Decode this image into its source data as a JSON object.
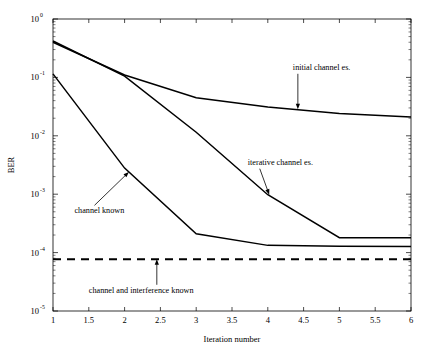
{
  "chart_data": {
    "type": "line",
    "title": "",
    "xlabel": "Iteration number",
    "ylabel": "BER",
    "xscale": "linear",
    "yscale": "log",
    "xlim": [
      1,
      6
    ],
    "ylim": [
      1e-05,
      1
    ],
    "grid": false,
    "legend": "annotations-on-plot",
    "xticks": [
      "1",
      "1.5",
      "2",
      "2.5",
      "3",
      "3.5",
      "4",
      "4.5",
      "5",
      "5.5",
      "6"
    ],
    "xtick_values": [
      1,
      1.5,
      2,
      2.5,
      3,
      3.5,
      4,
      4.5,
      5,
      5.5,
      6
    ],
    "ytick_labels": [
      "10^0",
      "10^-1",
      "10^-2",
      "10^-3",
      "10^-4",
      "10^-5"
    ],
    "ytick_mantissa": [
      "10",
      "10",
      "10",
      "10",
      "10",
      "10"
    ],
    "ytick_exponents": [
      "0",
      "-1",
      "-2",
      "-3",
      "-4",
      "-5"
    ],
    "ytick_values": [
      1,
      0.1,
      0.01,
      0.001,
      0.0001,
      1e-05
    ],
    "series": [
      {
        "name": "initial channel es.",
        "style": "solid",
        "x": [
          1,
          2,
          3,
          4,
          5,
          6
        ],
        "values": [
          0.4,
          0.11,
          0.045,
          0.031,
          0.024,
          0.021
        ]
      },
      {
        "name": "iterative channel es.",
        "style": "solid",
        "x": [
          1,
          2,
          3,
          4,
          5,
          6
        ],
        "values": [
          0.42,
          0.105,
          0.0115,
          0.00098,
          0.00018,
          0.00018
        ]
      },
      {
        "name": "channel known",
        "style": "solid",
        "x": [
          1,
          2,
          3,
          4,
          5,
          6
        ],
        "values": [
          0.115,
          0.0028,
          0.00021,
          0.000133,
          0.000128,
          0.000127
        ]
      },
      {
        "name": "channel and interference known",
        "style": "dashed",
        "x": [
          1,
          6
        ],
        "values": [
          7.7e-05,
          7.7e-05
        ]
      }
    ],
    "annotations": [
      {
        "label": "initial channel es.",
        "text_x": 4.35,
        "text_y": 0.135,
        "point_x": 4.42,
        "point_y": 0.0285,
        "arrow": "down"
      },
      {
        "label": "iterative channel es.",
        "text_x": 3.72,
        "text_y": 0.0032,
        "point_x": 4.02,
        "point_y": 0.00098,
        "arrow": "down-left"
      },
      {
        "label": "channel known",
        "text_x": 1.3,
        "text_y": 0.00047,
        "point_x": 2.06,
        "point_y": 0.0024,
        "arrow": "up-right"
      },
      {
        "label": "channel and interference known",
        "text_x": 1.5,
        "text_y": 2.05e-05,
        "point_x": 2.45,
        "point_y": 7.7e-05,
        "arrow": "up"
      }
    ]
  }
}
